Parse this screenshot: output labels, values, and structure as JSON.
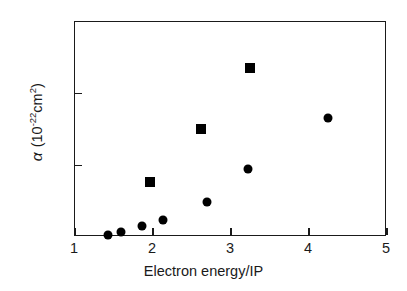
{
  "chart_data": {
    "type": "scatter",
    "title": "",
    "xlabel": "Electron energy/IP",
    "ylabel": "α  (10-22cm2)",
    "ylabel_parts": {
      "symbol": "α",
      "open": "(10",
      "exponent": "-22",
      "unit": "cm",
      "unit_exponent": "2",
      "close": ")"
    },
    "xlim": [
      1,
      5
    ],
    "ylim": [
      0,
      1.5
    ],
    "xticks": [
      1,
      2,
      3,
      4,
      5
    ],
    "yticks": [
      0,
      0.5,
      1,
      1.5
    ],
    "xticklabels": [
      "1",
      "2",
      "3",
      "4",
      "5"
    ],
    "yticklabels": [
      "0",
      "0.5",
      "1",
      "1.5"
    ],
    "grid": false,
    "legend": false,
    "legend_position": "none",
    "series": [
      {
        "name": "circles",
        "marker": "circle",
        "color": "#000000",
        "points": [
          {
            "x": 1.44,
            "y": 0.01
          },
          {
            "x": 1.6,
            "y": 0.03
          },
          {
            "x": 1.87,
            "y": 0.07
          },
          {
            "x": 2.14,
            "y": 0.11
          },
          {
            "x": 2.71,
            "y": 0.24
          },
          {
            "x": 3.23,
            "y": 0.47
          },
          {
            "x": 4.26,
            "y": 0.82
          }
        ]
      },
      {
        "name": "squares",
        "marker": "square",
        "color": "#000000",
        "points": [
          {
            "x": 1.97,
            "y": 0.38
          },
          {
            "x": 2.63,
            "y": 0.75
          },
          {
            "x": 3.26,
            "y": 1.17
          }
        ]
      }
    ]
  }
}
